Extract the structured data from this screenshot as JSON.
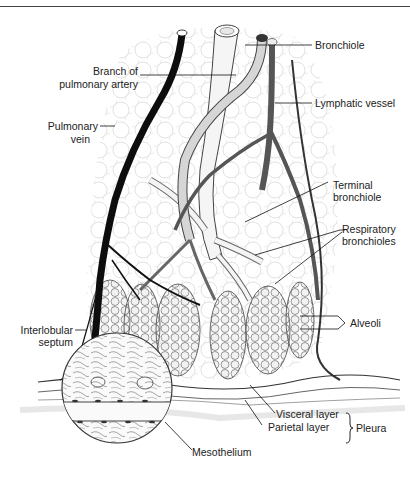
{
  "figure": {
    "labels": {
      "bronchiole": "Bronchiole",
      "branch_artery_1": "Branch of",
      "branch_artery_2": "pulmonary artery",
      "lymphatic": "Lymphatic vessel",
      "pulm_vein_1": "Pulmonary",
      "pulm_vein_2": "vein",
      "terminal_1": "Terminal",
      "terminal_2": "bronchiole",
      "respiratory_1": "Respiratory",
      "respiratory_2": "bronchioles",
      "alveoli": "Alveoli",
      "septum_1": "Interlobular",
      "septum_2": "septum",
      "visceral": "Visceral layer",
      "parietal": "Parietal layer",
      "pleura": "Pleura",
      "mesothelium": "Mesothelium"
    },
    "colors": {
      "ink": "#111111",
      "vein": "#0d0d0d",
      "lymph": "#555555",
      "artery_fill": "#d8d8d8",
      "bronchiole_fill": "#f4f4f4",
      "alveoli_fill": "#eeeeee",
      "background": "#ffffff"
    }
  }
}
